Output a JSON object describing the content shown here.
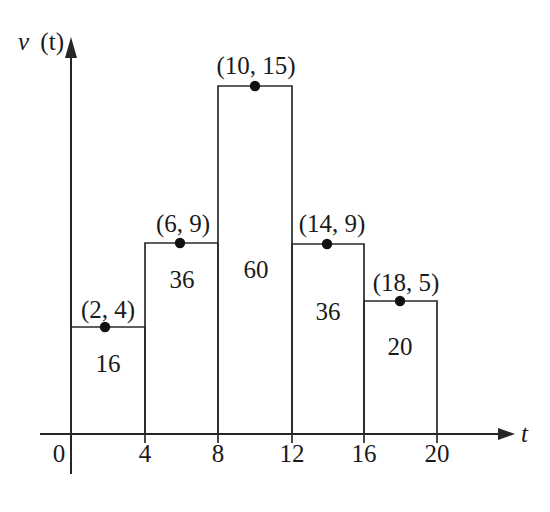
{
  "figure": {
    "title": "",
    "background_color": "#ffffff",
    "line_color": "#2a2a2a",
    "text_color": "#1a1a1a"
  },
  "axes": {
    "x_label": "t",
    "y_label_var": "v",
    "y_label_arg": "(t)",
    "origin_label": "0",
    "x_ticks": [
      "4",
      "8",
      "12",
      "16",
      "20"
    ],
    "x_tick_values": [
      4,
      8,
      12,
      16,
      20
    ],
    "x_range": [
      0,
      22
    ],
    "y_range": [
      0,
      17
    ]
  },
  "chart_data": {
    "type": "bar",
    "title": "",
    "xlabel": "t",
    "ylabel": "v (t)",
    "xlim": [
      0,
      22
    ],
    "ylim": [
      0,
      17
    ],
    "grid": false,
    "legend": "none",
    "bar_width": 4,
    "categories": [
      "0-4",
      "4-8",
      "8-12",
      "12-16",
      "16-20"
    ],
    "x_edges": [
      0,
      4,
      8,
      12,
      16,
      20
    ],
    "values": [
      4,
      9,
      15,
      9,
      5
    ],
    "midpoints": [
      2,
      6,
      10,
      14,
      18
    ],
    "point_labels": [
      "(2, 4)",
      "(6, 9)",
      "(10, 15)",
      "(14, 9)",
      "(18, 5)"
    ],
    "area_labels": [
      "16",
      "36",
      "60",
      "36",
      "20"
    ],
    "areas": [
      16,
      36,
      60,
      36,
      20
    ],
    "bars": [
      {
        "name": "bar-0-4",
        "x_start": 0,
        "x_end": 4,
        "height": 15,
        "area": 16,
        "area_label": "16",
        "midpoint": 2,
        "point_label": "(2, 4)",
        "point_x": 2,
        "point_y": 4,
        "px_left": 71,
        "px_right": 145,
        "px_top": 327,
        "px_dot_x": 105,
        "label_px_x": 108,
        "label_px_y": 318,
        "area_px_x": 108,
        "area_px_y": 372
      },
      {
        "name": "bar-4-8",
        "x_start": 4,
        "x_end": 8,
        "height": 9,
        "area": 36,
        "area_label": "36",
        "midpoint": 6,
        "point_label": "(6, 9)",
        "point_x": 6,
        "point_y": 9,
        "px_left": 145,
        "px_right": 218,
        "px_top": 243,
        "px_dot_x": 180,
        "label_px_x": 183,
        "label_px_y": 232,
        "area_px_x": 182,
        "area_px_y": 288
      },
      {
        "name": "bar-8-12",
        "x_start": 8,
        "x_end": 12,
        "height": 15,
        "area": 60,
        "area_label": "60",
        "midpoint": 10,
        "point_label": "(10, 15)",
        "point_x": 10,
        "point_y": 15,
        "px_left": 218,
        "px_right": 292,
        "px_top": 86,
        "px_dot_x": 255,
        "label_px_x": 256,
        "label_px_y": 74,
        "area_px_x": 256,
        "area_px_y": 278
      },
      {
        "name": "bar-12-16",
        "x_start": 12,
        "x_end": 16,
        "height": 9,
        "area": 36,
        "area_label": "36",
        "midpoint": 14,
        "point_label": "(14, 9)",
        "point_x": 14,
        "point_y": 9,
        "px_left": 292,
        "px_right": 364,
        "px_top": 244,
        "px_dot_x": 327,
        "label_px_x": 332,
        "label_px_y": 232,
        "area_px_x": 328,
        "area_px_y": 320
      },
      {
        "name": "bar-16-20",
        "x_start": 16,
        "x_end": 20,
        "height": 5,
        "area": 20,
        "area_label": "20",
        "midpoint": 18,
        "point_label": "(18, 5)",
        "point_x": 18,
        "point_y": 5,
        "px_left": 364,
        "px_right": 437,
        "px_top": 301,
        "px_dot_x": 400,
        "label_px_x": 406,
        "label_px_y": 291,
        "area_px_x": 400,
        "area_px_y": 355
      }
    ]
  },
  "geometry": {
    "x_axis_y": 434,
    "y_axis_x": 71,
    "y_axis_top": 44,
    "y_axis_bottom": 474,
    "x_axis_right": 512,
    "tick_px": [
      145,
      218,
      292,
      364,
      437
    ],
    "tick_label_px_y": 462,
    "origin_px_x": 59,
    "origin_px_y": 462,
    "x_label_px_x": 521,
    "x_label_px_y": 442,
    "y_label_px_x": 18,
    "y_label_px_y": 50
  }
}
